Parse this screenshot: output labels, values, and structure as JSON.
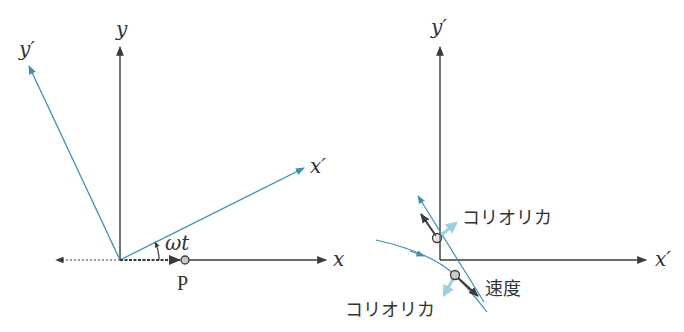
{
  "colors": {
    "axis": "#3a3a3a",
    "rotating": "#3f8fb3",
    "coriolis": "#9fd0de",
    "particle_fill": "#c9c9c9",
    "background": "#ffffff"
  },
  "left_panel": {
    "labels": {
      "y": "y",
      "y_prime": "y′",
      "x": "x",
      "x_prime": "x′",
      "angle": "ωt",
      "point": "P"
    }
  },
  "right_panel": {
    "labels": {
      "y_prime": "y′",
      "x_prime": "x′",
      "coriolis_upper": "コリオリカ",
      "velocity": "速度",
      "coriolis_lower": "コリオリカ"
    }
  }
}
